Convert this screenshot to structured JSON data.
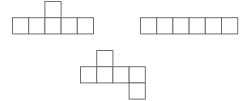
{
  "diagram": {
    "title": "",
    "cell_size": 16.2,
    "stroke_color": "#6e6e6e",
    "background": "#ffffff",
    "figures": [
      {
        "name": "net-a",
        "description": "row of five squares with one square on top of the middle square",
        "origin": [
          12.5,
          1.5
        ],
        "cells": [
          [
            2,
            0
          ],
          [
            0,
            1
          ],
          [
            1,
            1
          ],
          [
            2,
            1
          ],
          [
            3,
            1
          ],
          [
            4,
            1
          ]
        ]
      },
      {
        "name": "net-b",
        "description": "single row of six squares",
        "origin": [
          140.5,
          1.5
        ],
        "cells": [
          [
            0,
            1
          ],
          [
            1,
            1
          ],
          [
            2,
            1
          ],
          [
            3,
            1
          ],
          [
            4,
            1
          ],
          [
            5,
            1
          ]
        ]
      },
      {
        "name": "net-c",
        "description": "row of four squares, one square above the second, one square below the fourth",
        "origin": [
          80.5,
          50.5
        ],
        "cells": [
          [
            1,
            0
          ],
          [
            0,
            1
          ],
          [
            1,
            1
          ],
          [
            2,
            1
          ],
          [
            3,
            1
          ],
          [
            3,
            2
          ]
        ]
      }
    ]
  }
}
